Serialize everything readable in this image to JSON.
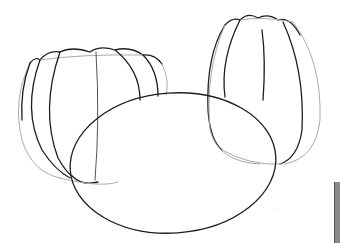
{
  "drawing": {
    "subject": "sketch of three rounded shapes",
    "shapes": [
      {
        "name": "wide-pumpkin",
        "description": "wide ribbed pumpkin outline, left"
      },
      {
        "name": "tall-pumpkin",
        "description": "tall ribbed pumpkin outline, right"
      },
      {
        "name": "ellipse",
        "description": "large plain ellipse overlapping both, center"
      }
    ],
    "colors": {
      "background": "#ffffff",
      "line_dark": "#1e1e1e",
      "line_light": "#aaaaaa",
      "edge_frame": "#8a8a8a"
    }
  }
}
